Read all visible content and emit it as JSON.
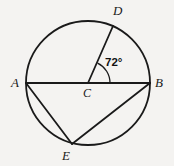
{
  "figure": {
    "type": "circle-geometry-diagram",
    "background_color": "#f4f3f1",
    "stroke_color": "#1a1a1a",
    "labels": {
      "A": "A",
      "B": "B",
      "C": "C",
      "D": "D",
      "E": "E",
      "angle": "72°"
    },
    "angle_value": "72°",
    "angle_vertex": "C",
    "angle_rays": [
      "B",
      "D"
    ],
    "points": {
      "A": {
        "x": 26,
        "y": 83,
        "on": "circle"
      },
      "B": {
        "x": 150,
        "y": 83,
        "on": "circle"
      },
      "C": {
        "x": 88,
        "y": 83,
        "on": "center"
      },
      "D": {
        "x": 113,
        "y": 26,
        "on": "circle"
      },
      "E": {
        "x": 72,
        "y": 144,
        "on": "circle"
      }
    },
    "circle": {
      "cx": 88,
      "cy": 83,
      "r": 62
    },
    "segments": [
      {
        "name": "diameter-AB",
        "from": "A",
        "to": "B"
      },
      {
        "name": "radius-CD",
        "from": "C",
        "to": "D"
      },
      {
        "name": "chord-AE",
        "from": "A",
        "to": "E"
      },
      {
        "name": "chord-EB",
        "from": "E",
        "to": "B"
      }
    ]
  }
}
